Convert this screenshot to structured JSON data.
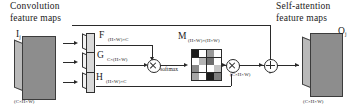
{
  "diagram": {
    "title_left": "Convolution",
    "title_left_2": "feature maps",
    "title_right": "Self-attention",
    "title_right_2": "feature maps",
    "input_symbol": "I",
    "input_subscript": "j",
    "input_dims": "(C×H×W)",
    "output_symbol": "O",
    "output_subscript": "j",
    "output_dims": "(C×H×W)",
    "branches": [
      {
        "name": "branch-f",
        "symbol": "F",
        "dims": "(H×W)×C"
      },
      {
        "name": "branch-g",
        "symbol": "G",
        "dims": "C×(H×W)"
      },
      {
        "name": "branch-h",
        "symbol": "H",
        "dims": "(H×W)×C"
      }
    ],
    "attention": {
      "symbol": "M",
      "dims": "(H×W)×(H×W)",
      "softmax_label": "softmax",
      "grid_shades": [
        [
          "#1c1c1c",
          "#ffffff",
          "#9a9a9a",
          "#ffffff"
        ],
        [
          "#ffffff",
          "#b5b5b5",
          "#6e6e6e",
          "#ffffff"
        ],
        [
          "#8a8a8a",
          "#ffffff",
          "#ffffff",
          "#c4c4c4"
        ],
        [
          "#a5a5a5",
          "#ffffff",
          "#1c1c1c",
          "#7d7d7d"
        ]
      ]
    },
    "operators": [
      {
        "name": "matmul-fg",
        "glyph": "⊗"
      },
      {
        "name": "matmul-mh",
        "glyph": "⊗"
      },
      {
        "name": "elementwise-sum",
        "glyph": "⊕"
      }
    ],
    "intermediate_dims": "(C×H×W)",
    "colors": {
      "ink": "#1a1a1a",
      "line": "#2a2a2a",
      "slab_face": "#8d8d8d",
      "slab_side": "#b9b9b9"
    }
  }
}
